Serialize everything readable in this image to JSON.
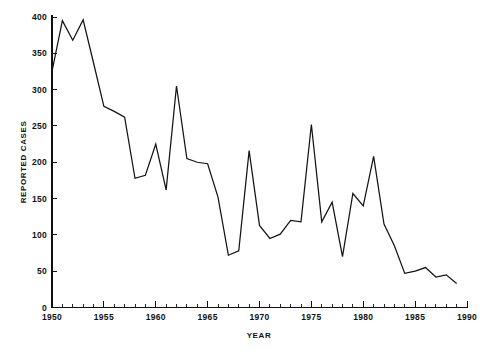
{
  "chart_data": {
    "type": "line",
    "title": "",
    "xlabel": "YEAR",
    "ylabel": "REPORTED CASES",
    "xlim": [
      1950,
      1990
    ],
    "ylim": [
      0,
      400
    ],
    "grid": false,
    "legend": null,
    "x_ticks_major": [
      1950,
      1955,
      1960,
      1965,
      1970,
      1975,
      1980,
      1985,
      1990
    ],
    "x_tick_labels": [
      "1950",
      "1955",
      "1960",
      "1965",
      "1970",
      "1975",
      "1980",
      "1985",
      "1990"
    ],
    "x_tick_minor_step": 1,
    "y_ticks": [
      0,
      50,
      100,
      150,
      200,
      250,
      300,
      350,
      400
    ],
    "y_tick_labels": [
      "0",
      "50",
      "100",
      "150",
      "200",
      "250",
      "300",
      "350",
      "400"
    ],
    "x": [
      1950,
      1951,
      1952,
      1953,
      1954,
      1955,
      1956,
      1957,
      1958,
      1959,
      1960,
      1961,
      1962,
      1963,
      1964,
      1965,
      1966,
      1967,
      1968,
      1969,
      1970,
      1971,
      1972,
      1973,
      1974,
      1975,
      1976,
      1977,
      1978,
      1979,
      1980,
      1981,
      1982,
      1983,
      1984,
      1985,
      1986,
      1987,
      1988,
      1989
    ],
    "values": [
      325,
      395,
      368,
      396,
      337,
      277,
      270,
      262,
      178,
      182,
      225,
      162,
      305,
      205,
      200,
      198,
      152,
      72,
      78,
      216,
      113,
      95,
      101,
      120,
      118,
      252,
      118,
      145,
      70,
      157,
      140,
      208,
      115,
      85,
      47,
      50,
      55,
      42,
      45,
      33
    ],
    "series_name": "Reported cases",
    "line_color": "#141414"
  },
  "axes": {
    "x_title": "YEAR",
    "y_title": "REPORTED CASES"
  }
}
